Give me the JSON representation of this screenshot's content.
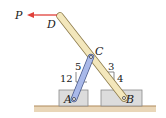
{
  "diagram": {
    "force": {
      "label": "P",
      "color": "#e0403a",
      "direction": "left"
    },
    "points": {
      "A": "A",
      "B": "B",
      "C": "C",
      "D": "D"
    },
    "slope_left": {
      "rise": "12",
      "run": "5"
    },
    "slope_right": {
      "rise": "4",
      "run": "3"
    },
    "colors": {
      "long_bar": "#f2e6b8",
      "short_bar": "#a8b8e8",
      "block": "#d9d9d9",
      "ground": "#c9a57a"
    }
  }
}
